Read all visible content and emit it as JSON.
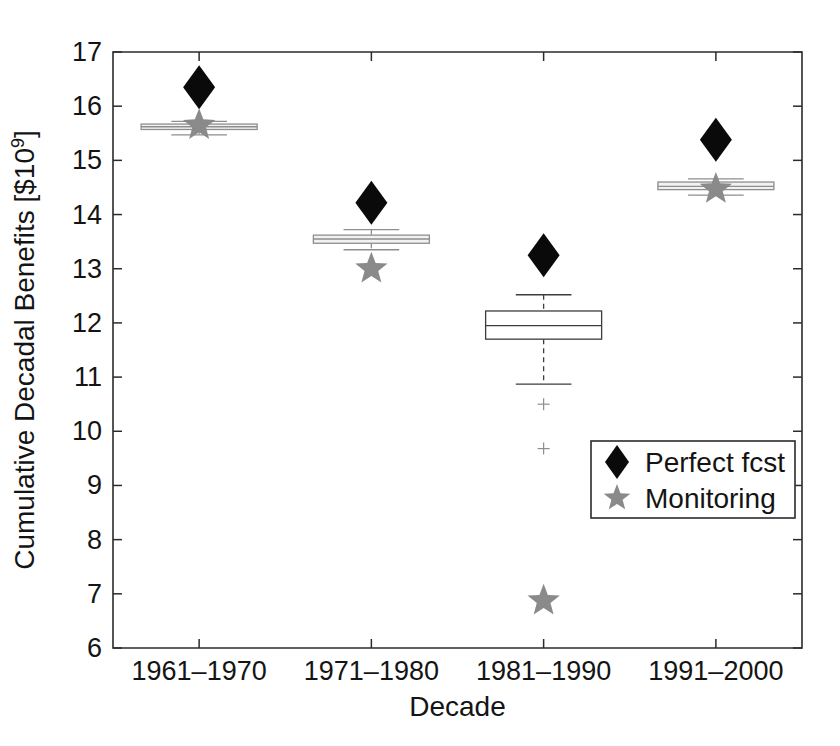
{
  "chart_data": {
    "type": "box",
    "title": "",
    "xlabel": "Decade",
    "ylabel": "Cumulative Decadal Benefits [$10",
    "ylabel_superscript": "9",
    "ylabel_suffix": "]",
    "categories": [
      "1961–1970",
      "1971–1980",
      "1981–1990",
      "1991–2000"
    ],
    "ylim": [
      6,
      17
    ],
    "yticks": [
      6,
      7,
      8,
      9,
      10,
      11,
      12,
      13,
      14,
      15,
      16,
      17
    ],
    "ytick_labels": [
      "6",
      "7",
      "8",
      "9",
      "10",
      "11",
      "12",
      "13",
      "14",
      "15",
      "16",
      "17"
    ],
    "grid": false,
    "legend_position": "lower-right",
    "legend": [
      {
        "label": "Perfect fcst",
        "marker": "diamond",
        "color": "#0a0a0a"
      },
      {
        "label": "Monitoring",
        "marker": "star",
        "color": "#8a8a8a"
      }
    ],
    "boxes": [
      {
        "category": "1961–1970",
        "q1": 15.57,
        "median": 15.62,
        "q3": 15.67,
        "whisker_low": 15.47,
        "whisker_high": 15.72,
        "outliers": [],
        "style": "gray"
      },
      {
        "category": "1971–1980",
        "q1": 13.47,
        "median": 13.55,
        "q3": 13.62,
        "whisker_low": 13.35,
        "whisker_high": 13.72,
        "outliers": [],
        "style": "gray"
      },
      {
        "category": "1981–1990",
        "q1": 11.7,
        "median": 11.95,
        "q3": 12.22,
        "whisker_low": 10.87,
        "whisker_high": 12.52,
        "outliers": [
          10.5,
          9.68
        ],
        "style": "dark"
      },
      {
        "category": "1991–2000",
        "q1": 14.46,
        "median": 14.52,
        "q3": 14.6,
        "whisker_low": 14.36,
        "whisker_high": 14.66,
        "outliers": [],
        "style": "gray"
      }
    ],
    "series": [
      {
        "name": "Perfect fcst",
        "marker": "diamond",
        "color": "#0a0a0a",
        "values": [
          16.35,
          14.22,
          13.25,
          15.38
        ]
      },
      {
        "name": "Monitoring",
        "marker": "star",
        "color": "#8a8a8a",
        "values": [
          15.65,
          13.0,
          6.87,
          14.47
        ]
      }
    ]
  }
}
